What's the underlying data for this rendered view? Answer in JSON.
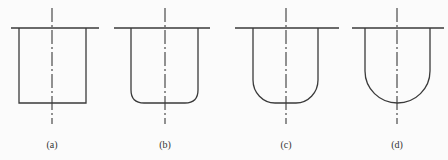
{
  "figures": [
    {
      "id": "a",
      "label": "(a)",
      "shape": "flat-bottom",
      "corner_radius": 0
    },
    {
      "id": "b",
      "label": "(b)",
      "shape": "small-radius-bottom",
      "corner_radius": 12
    },
    {
      "id": "c",
      "label": "(c)",
      "shape": "large-radius-bottom",
      "corner_radius": 22
    },
    {
      "id": "d",
      "label": "(d)",
      "shape": "hemispherical-bottom",
      "corner_radius": 32
    }
  ]
}
